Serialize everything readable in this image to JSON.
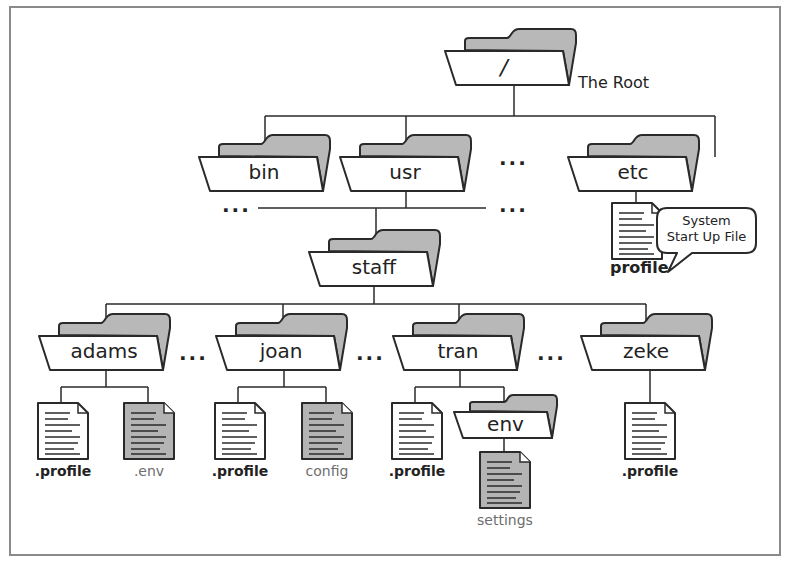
{
  "diagram": {
    "type": "unix-directory-tree",
    "root": {
      "label": "/",
      "annotation": "The Root"
    },
    "level1": [
      {
        "label": "bin"
      },
      {
        "label": "usr"
      },
      {
        "label": "etc"
      }
    ],
    "level1_ellipsis": [
      "...",
      "...",
      "..."
    ],
    "etc_file": {
      "label": "profile",
      "callout": [
        "System",
        "Start Up File"
      ]
    },
    "usr_child": {
      "label": "staff"
    },
    "users": [
      {
        "label": "adams",
        "files": [
          {
            "label": ".profile",
            "shaded": false
          },
          {
            "label": ".env",
            "shaded": true
          }
        ]
      },
      {
        "label": "joan",
        "files": [
          {
            "label": ".profile",
            "shaded": false
          },
          {
            "label": "config",
            "shaded": true
          }
        ]
      },
      {
        "label": "tran",
        "files": [
          {
            "label": ".profile",
            "shaded": false
          }
        ],
        "subfolder": {
          "label": "env",
          "files": [
            {
              "label": "settings",
              "shaded": true
            }
          ]
        }
      },
      {
        "label": "zeke",
        "files": [
          {
            "label": ".profile",
            "shaded": false
          }
        ]
      }
    ],
    "users_ellipsis": [
      "...",
      "...",
      "..."
    ],
    "colors": {
      "line": "#2a2a2a",
      "folder_back": "#b8b8b8",
      "shaded_file": "#b4b4b4",
      "frame": "#8a8a8a",
      "gray_text": "#6d6d6d"
    }
  }
}
